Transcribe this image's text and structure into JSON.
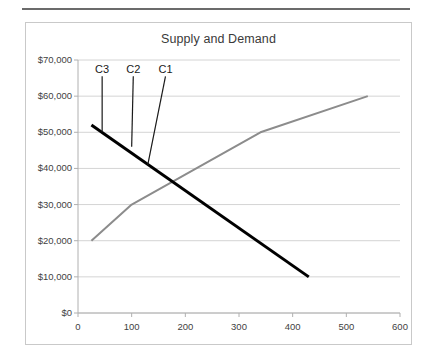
{
  "chart_data": {
    "type": "line",
    "title": "Supply and Demand",
    "xlabel": "",
    "ylabel": "",
    "xlim": [
      0,
      600
    ],
    "ylim": [
      0,
      70000
    ],
    "grid": true,
    "legend_position": "none",
    "xticks": [
      "0",
      "100",
      "200",
      "300",
      "400",
      "500",
      "600"
    ],
    "xtick_values": [
      0,
      100,
      200,
      300,
      400,
      500,
      600
    ],
    "yticks": [
      "$0",
      "$10,000",
      "$20,000",
      "$30,000",
      "$40,000",
      "$50,000",
      "$60,000",
      "$70,000"
    ],
    "ytick_values": [
      0,
      10000,
      20000,
      30000,
      40000,
      50000,
      60000,
      70000
    ],
    "series": [
      {
        "name": "Supply",
        "color": "#8c8c8c",
        "width": 2,
        "points": [
          [
            25,
            20000
          ],
          [
            100,
            30000
          ],
          [
            340,
            50000
          ],
          [
            540,
            60000
          ]
        ]
      },
      {
        "name": "Demand",
        "color": "#000000",
        "width": 3,
        "points": [
          [
            25,
            52000
          ],
          [
            430,
            10000
          ]
        ]
      }
    ],
    "annotations": [
      {
        "label": "C3",
        "label_x": 45,
        "label_y": 65500,
        "target_x": 45,
        "target_y": 50000,
        "leader_color": "#1a1a1a"
      },
      {
        "label": "C2",
        "label_x": 103,
        "label_y": 65500,
        "target_x": 100,
        "target_y": 46000,
        "leader_color": "#1a1a1a"
      },
      {
        "label": "C1",
        "label_x": 163,
        "label_y": 65500,
        "target_x": 130,
        "target_y": 41000,
        "leader_color": "#1a1a1a"
      }
    ]
  },
  "colors": {
    "supply": "#8c8c8c",
    "demand": "#000000",
    "grid": "#d4d4d4",
    "axis": "#b0b0b0",
    "frame": "#c9c9c9",
    "rule": "#6b6b6b",
    "text": "#3f3f3f",
    "title": "#3a3a3a"
  }
}
